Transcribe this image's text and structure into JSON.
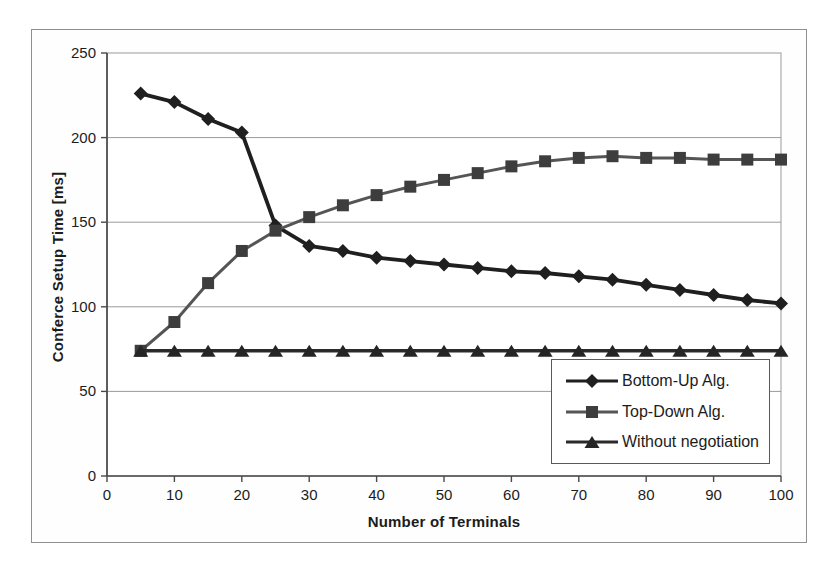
{
  "chart_data": {
    "type": "line",
    "title": "",
    "xlabel": "Number of Terminals",
    "ylabel": "Conferce Setup Time [ms]",
    "x": [
      5,
      10,
      15,
      20,
      25,
      30,
      35,
      40,
      45,
      50,
      55,
      60,
      65,
      70,
      75,
      80,
      85,
      90,
      95,
      100
    ],
    "xlim": [
      0,
      100
    ],
    "ylim": [
      0,
      250
    ],
    "x_ticks": [
      0,
      10,
      20,
      30,
      40,
      50,
      60,
      70,
      80,
      90,
      100
    ],
    "y_ticks": [
      0,
      50,
      100,
      150,
      200,
      250
    ],
    "grid": "horizontal",
    "legend_position": "inside-bottom-right",
    "series": [
      {
        "name": "Bottom-Up Alg.",
        "marker": "diamond",
        "color": "#1f1f1f",
        "line_color": "#1f1f1f",
        "line_width": 3.8,
        "values": [
          226,
          221,
          211,
          203,
          148,
          136,
          133,
          129,
          127,
          125,
          123,
          121,
          120,
          118,
          116,
          113,
          110,
          107,
          104,
          102
        ]
      },
      {
        "name": "Top-Down Alg.",
        "marker": "square",
        "color": "#3d3d3d",
        "line_color": "#555555",
        "line_width": 3.0,
        "values": [
          74,
          91,
          114,
          133,
          145,
          153,
          160,
          166,
          171,
          175,
          179,
          183,
          186,
          188,
          189,
          188,
          188,
          187,
          187,
          187
        ]
      },
      {
        "name": "Without negotiation",
        "marker": "triangle",
        "color": "#252525",
        "line_color": "#2a2a2a",
        "line_width": 3.4,
        "values": [
          74,
          74,
          74,
          74,
          74,
          74,
          74,
          74,
          74,
          74,
          74,
          74,
          74,
          74,
          74,
          74,
          74,
          74,
          74,
          74
        ]
      }
    ]
  },
  "colors": {
    "background": "#ffffff",
    "plot_border": "#9a9a9a",
    "gridline": "#9a9a9a",
    "axis": "#4a4a4a",
    "text": "#1c1c1c",
    "frame_border": "#8f8f8f",
    "legend_border": "#5a5a5a"
  }
}
